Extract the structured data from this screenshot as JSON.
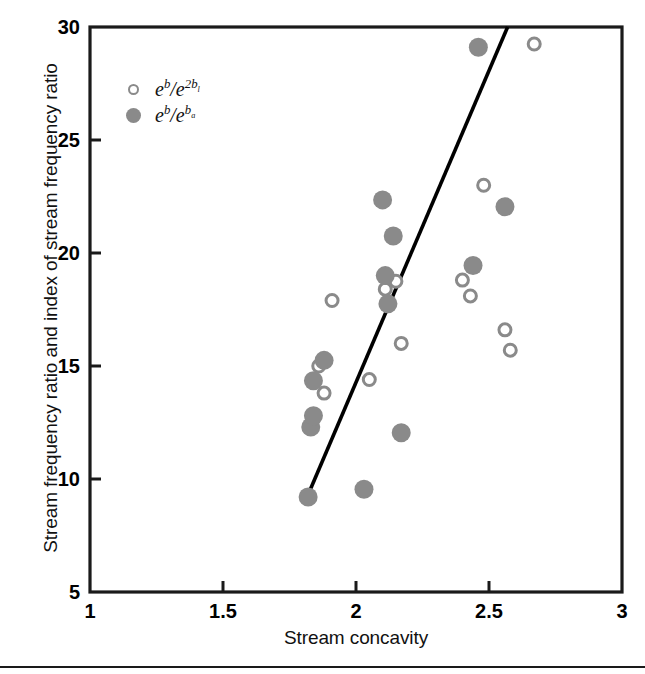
{
  "chart_data": {
    "type": "scatter",
    "title": "",
    "xlabel": "Stream concavity",
    "ylabel": "Stream frequency ratio and index of stream frequency ratio",
    "xlim": [
      1,
      3
    ],
    "ylim": [
      5,
      30
    ],
    "xticks": [
      "1",
      "1.5",
      "2",
      "2.5",
      "3"
    ],
    "xtick_values": [
      1,
      1.5,
      2,
      2.5,
      3
    ],
    "yticks": [
      "5",
      "10",
      "15",
      "20",
      "25",
      "30"
    ],
    "ytick_values": [
      5,
      10,
      15,
      20,
      25,
      30
    ],
    "grid": false,
    "legend_position": "upper-left",
    "series": [
      {
        "name": "e^b/e^2b_l",
        "label_html": "e<sup>b</sup>/e<sup>2b<sub>l</sub></sup>",
        "marker": "open-circle",
        "color": "#8a8a8a",
        "points": [
          [
            1.86,
            15.0
          ],
          [
            1.88,
            13.8
          ],
          [
            1.91,
            17.9
          ],
          [
            2.05,
            14.4
          ],
          [
            2.11,
            18.4
          ],
          [
            2.15,
            18.75
          ],
          [
            2.17,
            16.0
          ],
          [
            2.4,
            18.8
          ],
          [
            2.43,
            18.1
          ],
          [
            2.48,
            23.0
          ],
          [
            2.56,
            16.6
          ],
          [
            2.58,
            15.7
          ],
          [
            2.67,
            29.25
          ]
        ]
      },
      {
        "name": "e^b/e^b_a",
        "label_html": "e<sup>b</sup>/e<sup>b<sub>a</sub></sup>",
        "marker": "filled-circle",
        "color": "#8a8a8a",
        "points": [
          [
            1.82,
            9.2
          ],
          [
            1.83,
            12.3
          ],
          [
            1.84,
            12.8
          ],
          [
            1.84,
            14.35
          ],
          [
            1.88,
            15.25
          ],
          [
            2.03,
            9.55
          ],
          [
            2.1,
            22.35
          ],
          [
            2.11,
            19.0
          ],
          [
            2.12,
            17.75
          ],
          [
            2.14,
            20.75
          ],
          [
            2.17,
            12.05
          ],
          [
            2.44,
            19.45
          ],
          [
            2.46,
            29.1
          ],
          [
            2.56,
            22.05
          ]
        ]
      }
    ],
    "trendline": {
      "label": "regression-line",
      "color": "#000000",
      "x_start": 1.825,
      "y_start": 9.45,
      "x_end": 2.57,
      "y_end": 30.0
    }
  },
  "axis": {
    "frame_color": "#1a1a1a"
  }
}
